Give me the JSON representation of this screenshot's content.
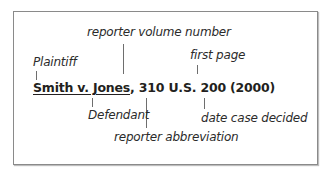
{
  "citation": {
    "case_name": "Smith v. Jones",
    "separator": ", ",
    "volume": "310",
    "reporter": "U.S.",
    "page": "200",
    "year": "(2000)"
  },
  "labels": {
    "plaintiff": "Plaintiff",
    "reporter_volume_number": "reporter volume number",
    "first_page": "first page",
    "defendant": "Defendant",
    "reporter_abbreviation": "reporter abbreviation",
    "date_case_decided": "date case decided"
  },
  "colors": {
    "text": "#231f20",
    "border": "#8a8a8a",
    "connector": "#6e6e6e"
  }
}
